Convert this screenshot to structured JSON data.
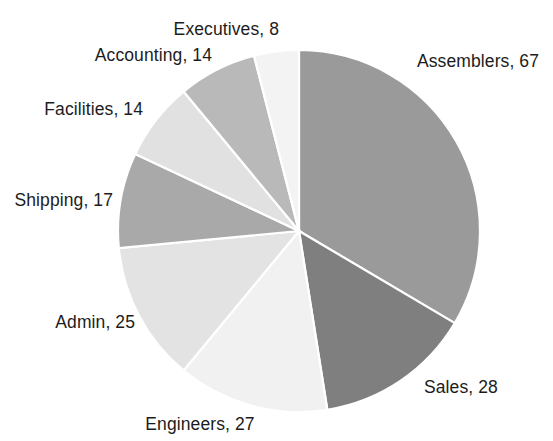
{
  "chart_data": {
    "type": "pie",
    "title": "",
    "subtitle": "",
    "xlabel": "",
    "ylabel": "",
    "legend_position": "none",
    "grid": false,
    "total": 200,
    "label_format": "category, value",
    "start_angle_deg": 0,
    "direction": "clockwise",
    "categories": [
      "Assemblers",
      "Sales",
      "Engineers",
      "Admin",
      "Shipping",
      "Facilities",
      "Accounting",
      "Executives"
    ],
    "values": [
      67,
      28,
      27,
      25,
      17,
      14,
      14,
      8
    ],
    "colors": [
      "#9a9a9a",
      "#7f7f7f",
      "#f1f1f1",
      "#e3e3e3",
      "#a9a9a9",
      "#e1e1e1",
      "#b9b9b9",
      "#f3f3f3"
    ],
    "slice_border_color": "#ffffff",
    "background_color": "#ffffff",
    "label_color": "#1c1c1c",
    "slices": [
      {
        "name": "Assemblers",
        "value": 67,
        "label": "Assemblers, 67",
        "color": "#9a9a9a",
        "label_x": 417,
        "label_y": 62,
        "label_anchor": "start"
      },
      {
        "name": "Sales",
        "value": 28,
        "label": "Sales, 28",
        "color": "#7f7f7f",
        "label_x": 424,
        "label_y": 388,
        "label_anchor": "start"
      },
      {
        "name": "Engineers",
        "value": 27,
        "label": "Engineers, 27",
        "color": "#f1f1f1",
        "label_x": 200,
        "label_y": 425,
        "label_anchor": "mid"
      },
      {
        "name": "Admin",
        "value": 25,
        "label": "Admin, 25",
        "color": "#e3e3e3",
        "label_x": 135,
        "label_y": 323,
        "label_anchor": "end"
      },
      {
        "name": "Shipping",
        "value": 17,
        "label": "Shipping, 17",
        "color": "#a9a9a9",
        "label_x": 113,
        "label_y": 201,
        "label_anchor": "end"
      },
      {
        "name": "Facilities",
        "value": 14,
        "label": "Facilities, 14",
        "color": "#e1e1e1",
        "label_x": 143,
        "label_y": 110,
        "label_anchor": "end"
      },
      {
        "name": "Accounting",
        "value": 14,
        "label": "Accounting, 14",
        "color": "#b9b9b9",
        "label_x": 212,
        "label_y": 56,
        "label_anchor": "end"
      },
      {
        "name": "Executives",
        "value": 8,
        "label": "Executives, 8",
        "color": "#f3f3f3",
        "label_x": 279,
        "label_y": 30,
        "label_anchor": "end"
      }
    ],
    "geometry": {
      "center_x": 299,
      "center_y": 231,
      "radius": 181
    }
  }
}
